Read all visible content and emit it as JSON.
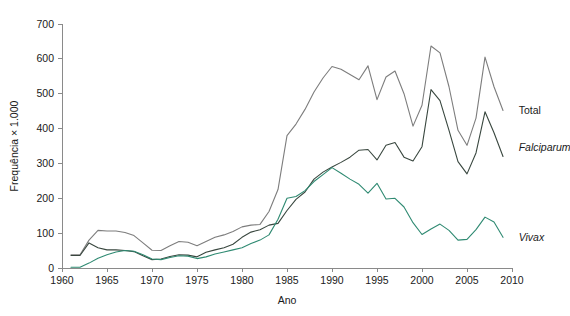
{
  "chart_data": {
    "type": "line",
    "title": "",
    "subtitle": "",
    "xlabel": "Ano",
    "ylabel": "Frequência × 1.000",
    "xlim": [
      1960,
      2010
    ],
    "ylim": [
      0,
      700
    ],
    "xticks": [
      1960,
      1965,
      1970,
      1975,
      1980,
      1985,
      1990,
      1995,
      2000,
      2005,
      2010
    ],
    "yticks": [
      0,
      100,
      200,
      300,
      400,
      500,
      600,
      700
    ],
    "grid": false,
    "legend_position": "right-inline-labels",
    "x": [
      1961,
      1962,
      1963,
      1964,
      1965,
      1966,
      1967,
      1968,
      1969,
      1970,
      1971,
      1972,
      1973,
      1974,
      1975,
      1976,
      1977,
      1978,
      1979,
      1980,
      1981,
      1982,
      1983,
      1984,
      1985,
      1986,
      1987,
      1988,
      1989,
      1990,
      1991,
      1992,
      1993,
      1994,
      1995,
      1996,
      1997,
      1998,
      1999,
      2000,
      2001,
      2002,
      2003,
      2004,
      2005,
      2006,
      2007,
      2008,
      2009
    ],
    "series": [
      {
        "name": "Total",
        "color": "#7d7d7d",
        "style": "normal",
        "values": [
          38,
          38,
          80,
          108,
          106,
          106,
          102,
          93,
          72,
          51,
          50,
          64,
          76,
          74,
          64,
          76,
          88,
          95,
          105,
          118,
          123,
          125,
          162,
          225,
          380,
          413,
          455,
          505,
          545,
          578,
          570,
          555,
          540,
          580,
          483,
          548,
          565,
          500,
          407,
          467,
          637,
          617,
          520,
          395,
          352,
          430,
          605,
          520,
          452
        ]
      },
      {
        "name": "Falciparum",
        "color": "#39473f",
        "style": "italic",
        "values": [
          36,
          36,
          72,
          58,
          52,
          52,
          50,
          47,
          35,
          24,
          26,
          33,
          38,
          37,
          32,
          45,
          52,
          58,
          68,
          88,
          103,
          110,
          123,
          128,
          165,
          197,
          218,
          255,
          275,
          290,
          303,
          318,
          338,
          340,
          310,
          352,
          360,
          318,
          307,
          348,
          512,
          480,
          395,
          305,
          270,
          330,
          448,
          388,
          320
        ]
      },
      {
        "name": "Vivax",
        "color": "#2f8a72",
        "style": "italic",
        "values": [
          2,
          2,
          14,
          28,
          38,
          46,
          50,
          48,
          38,
          26,
          24,
          30,
          35,
          34,
          27,
          32,
          40,
          46,
          52,
          58,
          70,
          80,
          95,
          140,
          200,
          205,
          222,
          248,
          268,
          288,
          272,
          255,
          240,
          215,
          243,
          198,
          200,
          175,
          130,
          96,
          112,
          126,
          108,
          80,
          82,
          110,
          146,
          132,
          88
        ]
      }
    ],
    "annotations": [
      {
        "text": "Total",
        "x": 2010.3,
        "y": 452,
        "style": "normal"
      },
      {
        "text": "Falciparum",
        "x": 2010.3,
        "y": 345,
        "style": "italic"
      },
      {
        "text": "Vivax",
        "x": 2010.3,
        "y": 88,
        "style": "italic"
      }
    ]
  }
}
